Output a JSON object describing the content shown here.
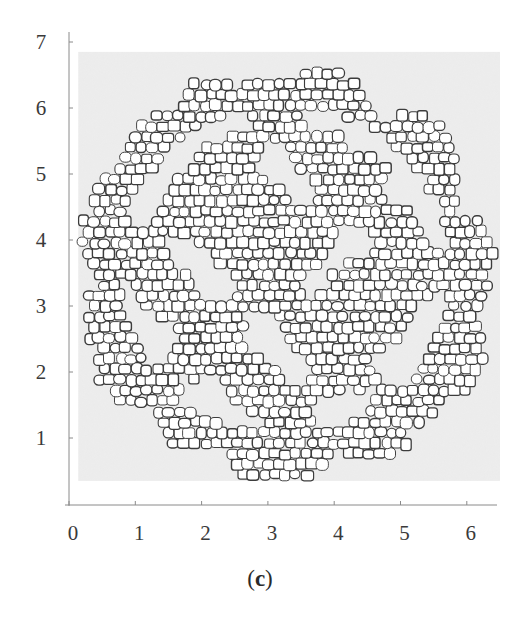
{
  "chart_data": {
    "type": "scatter",
    "title": "",
    "subtitle": "",
    "panel_label": "(c)",
    "panel_letter": "c",
    "xlabel": "",
    "ylabel": "",
    "xlim": [
      0,
      6.5
    ],
    "ylim": [
      0,
      7
    ],
    "x_ticks": [
      0,
      1,
      2,
      3,
      4,
      5,
      6
    ],
    "y_ticks": [
      1,
      2,
      3,
      4,
      5,
      6,
      7
    ],
    "x_tick_labels": [
      "0",
      "1",
      "2",
      "3",
      "4",
      "5",
      "6"
    ],
    "y_tick_labels": [
      "1",
      "2",
      "3",
      "4",
      "5",
      "6",
      "7"
    ],
    "grid": false,
    "legend": null,
    "plot_background_region": {
      "x": [
        0.14,
        6.5
      ],
      "y": [
        0.35,
        6.85
      ]
    },
    "colony": {
      "center": [
        3.25,
        3.55
      ],
      "outer_radius": 3.15,
      "scallop_lobes": [
        {
          "angle_deg": 90,
          "center": [
            3.0,
            6.0
          ],
          "r": 0.55
        },
        {
          "angle_deg": 72,
          "center": [
            3.85,
            6.15
          ],
          "r": 0.45
        },
        {
          "angle_deg": 45,
          "center": [
            5.2,
            5.3
          ],
          "r": 0.75
        },
        {
          "angle_deg": 10,
          "center": [
            5.9,
            3.9
          ],
          "r": 0.6
        },
        {
          "angle_deg": -25,
          "center": [
            5.6,
            2.3
          ],
          "r": 0.8
        },
        {
          "angle_deg": -65,
          "center": [
            4.6,
            1.2
          ],
          "r": 0.7
        },
        {
          "angle_deg": -95,
          "center": [
            3.0,
            0.9
          ],
          "r": 0.75
        },
        {
          "angle_deg": -140,
          "center": [
            1.1,
            2.2
          ],
          "r": 0.85
        },
        {
          "angle_deg": 175,
          "center": [
            0.45,
            4.0
          ],
          "r": 0.5
        },
        {
          "angle_deg": 135,
          "center": [
            1.4,
            5.3
          ],
          "r": 0.7
        }
      ],
      "approx_cell_count": 700,
      "cell_size": 0.16
    },
    "colors": {
      "plot_background": "#ebebeb",
      "cell_fill": "#ffffff",
      "cell_outline": "#3c3c3c",
      "axis": "#8a8a8a"
    }
  }
}
